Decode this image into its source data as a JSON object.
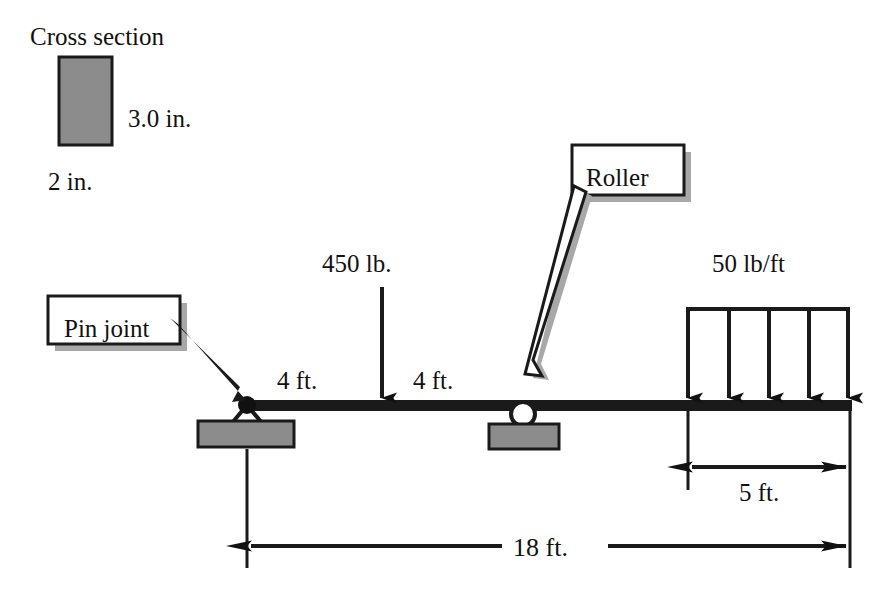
{
  "figure": {
    "type": "beam-free-body-diagram",
    "background_color": "#ffffff",
    "line_color": "#111111",
    "fill_gray": "#8c8c8c",
    "shadow_gray": "#a8a8a8"
  },
  "cross_section": {
    "title": "Cross section",
    "height_label": "3.0 in.",
    "width_label": "2 in."
  },
  "callouts": {
    "pin_joint": "Pin joint",
    "roller": "Roller"
  },
  "loads": {
    "point_load": "450 lb.",
    "distributed_load": "50 lb/ft",
    "distributed_arrow_count": 5
  },
  "dimensions": {
    "left_span": "4 ft.",
    "right_span": "4 ft.",
    "distributed_span": "5 ft.",
    "total_length": "18 ft."
  }
}
